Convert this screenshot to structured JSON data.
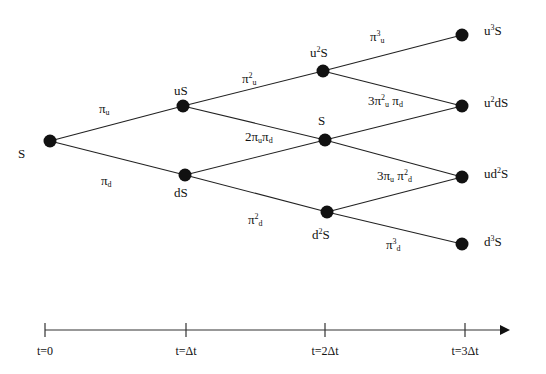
{
  "diagram": {
    "type": "binomial-tree",
    "steps": 3,
    "nodes": [
      {
        "id": "n0",
        "label": "S",
        "x": 50,
        "y": 141
      },
      {
        "id": "n1u",
        "label": "uS",
        "x": 183,
        "y": 106
      },
      {
        "id": "n1d",
        "label": "dS",
        "x": 185,
        "y": 175
      },
      {
        "id": "n2uu",
        "label": "u²S",
        "x": 323,
        "y": 71
      },
      {
        "id": "n2ud",
        "label": "S",
        "x": 325,
        "y": 140
      },
      {
        "id": "n2dd",
        "label": "d²S",
        "x": 327,
        "y": 212
      },
      {
        "id": "n3uuu",
        "label": "u³S",
        "x": 462,
        "y": 35
      },
      {
        "id": "n3uud",
        "label": "u²dS",
        "x": 462,
        "y": 106
      },
      {
        "id": "n3udd",
        "label": "ud²S",
        "x": 462,
        "y": 177
      },
      {
        "id": "n3ddd",
        "label": "d³S",
        "x": 462,
        "y": 244
      }
    ],
    "edges": [
      {
        "from": "n0",
        "to": "n1u"
      },
      {
        "from": "n0",
        "to": "n1d"
      },
      {
        "from": "n1u",
        "to": "n2uu"
      },
      {
        "from": "n1u",
        "to": "n2ud"
      },
      {
        "from": "n1d",
        "to": "n2ud"
      },
      {
        "from": "n1d",
        "to": "n2dd"
      },
      {
        "from": "n2uu",
        "to": "n3uuu"
      },
      {
        "from": "n2uu",
        "to": "n3uud"
      },
      {
        "from": "n2ud",
        "to": "n3uud"
      },
      {
        "from": "n2ud",
        "to": "n3udd"
      },
      {
        "from": "n2dd",
        "to": "n3udd"
      },
      {
        "from": "n2dd",
        "to": "n3ddd"
      }
    ],
    "node_labels": {
      "s0": "S",
      "us": "uS",
      "ds": "dS",
      "u2s": {
        "base": "u",
        "sup": "2",
        "tail": "S"
      },
      "s_mid": "S",
      "d2s": {
        "base": "d",
        "sup": "2",
        "tail": "S"
      },
      "u3s": {
        "base": "u",
        "sup": "3",
        "tail": "S"
      },
      "u2ds": {
        "base": "u",
        "sup": "2",
        "tail": "dS"
      },
      "ud2s": {
        "base": "ud",
        "sup": "2",
        "tail": "S"
      },
      "d3s": {
        "base": "d",
        "sup": "3",
        "tail": "S"
      }
    },
    "probability_labels": {
      "pi_u": {
        "pi": "π",
        "sub": "u"
      },
      "pi_d": {
        "pi": "π",
        "sub": "d"
      },
      "pi2_u": {
        "pi": "π",
        "sup": "2",
        "sub": "u"
      },
      "two_pu_pd": {
        "coef": "2",
        "pi1": "π",
        "sub1": "u",
        "pi2": "π",
        "sub2": "d"
      },
      "pi2_d": {
        "pi": "π",
        "sup": "2",
        "sub": "d"
      },
      "pi3_u": {
        "pi": "π",
        "sup": "3",
        "sub": "u"
      },
      "three_pu2_pd": {
        "coef": "3",
        "pi1": "π",
        "sup1": "2",
        "sub1": "u",
        "pi2": "π",
        "sub2": "d"
      },
      "three_pu_pd2": {
        "coef": "3",
        "pi1": "π",
        "sub1": "u",
        "pi2": "π",
        "sup2": "2",
        "sub2": "d"
      },
      "pi3_d": {
        "pi": "π",
        "sup": "3",
        "sub": "d"
      }
    }
  },
  "timeline": {
    "ticks": [
      {
        "label": "t=0",
        "x": 45
      },
      {
        "label": "t=Δt",
        "x": 186
      },
      {
        "label": "t=2Δt",
        "x": 325
      },
      {
        "label": "t=3Δt",
        "x": 465
      }
    ],
    "axis_y": 330,
    "axis_end_x": 510
  },
  "colors": {
    "ink": "#111111",
    "background": "#ffffff"
  }
}
